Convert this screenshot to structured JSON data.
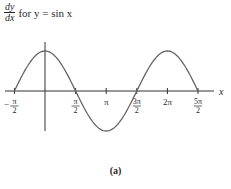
{
  "title": {
    "derivative_numerator": "dy",
    "derivative_denominator": "dx",
    "text": "for y = sin x"
  },
  "caption": "(a)",
  "colors": {
    "curve": "#666666",
    "axis": "#333333",
    "text": "#2a2a2a"
  },
  "chart_data": {
    "type": "line",
    "xlabel": "x",
    "ylabel": "",
    "function": "cos x",
    "x_tick_labels": [
      "-π/2",
      "π/2",
      "π",
      "3π/2",
      "2π",
      "5π/2"
    ],
    "x_tick_values": [
      -1.5708,
      1.5708,
      3.1416,
      4.7124,
      6.2832,
      7.854
    ],
    "x": [
      -1.5708,
      -0.7854,
      0,
      0.7854,
      1.5708,
      2.3562,
      3.1416,
      3.927,
      4.7124,
      5.4978,
      6.2832,
      7.0686,
      7.854
    ],
    "values": [
      0,
      0.707,
      1,
      0.707,
      0,
      -0.707,
      -1,
      -0.707,
      0,
      0.707,
      1,
      0.707,
      0
    ],
    "xlim": [
      -1.5708,
      7.854
    ],
    "ylim": [
      -1,
      1
    ],
    "grid": false,
    "legend": null
  }
}
